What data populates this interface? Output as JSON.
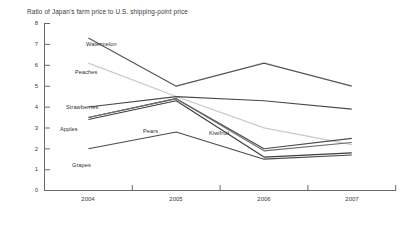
{
  "chart_data": {
    "type": "line",
    "title": "Ratio of Japan's farm price to U.S. shipping-point price",
    "xlabel": "",
    "ylabel": "",
    "categories": [
      "2004",
      "2005",
      "2006",
      "2007"
    ],
    "ylim": [
      0,
      8
    ],
    "yticks": [
      "0",
      "1",
      "2",
      "3",
      "4",
      "5",
      "6",
      "7",
      "8"
    ],
    "grid": false,
    "legend": "inline-labels",
    "series": [
      {
        "name": "Watermelon",
        "values": [
          7.3,
          5.0,
          6.1,
          5.0
        ],
        "color": "#555555"
      },
      {
        "name": "Peaches",
        "values": [
          6.1,
          4.5,
          3.0,
          2.2
        ],
        "color": "#c9c9c9"
      },
      {
        "name": "Strawberries",
        "values": [
          4.0,
          4.5,
          4.3,
          3.9
        ],
        "color": "#4a4a4a"
      },
      {
        "name": "Apples",
        "values": [
          3.5,
          4.4,
          2.0,
          2.5
        ],
        "color": "#4a4a4a"
      },
      {
        "name": "Pears",
        "values": [
          3.5,
          4.4,
          1.9,
          2.3
        ],
        "color": "#6e6e6e"
      },
      {
        "name": "Kiwifruit",
        "values": [
          3.4,
          4.3,
          1.6,
          1.8
        ],
        "color": "#3d3d3d"
      },
      {
        "name": "Grapes",
        "values": [
          2.0,
          2.8,
          1.5,
          1.7
        ],
        "color": "#4a4a4a"
      }
    ],
    "annotations": [
      {
        "text": "Watermelon",
        "x": 86,
        "y": 41
      },
      {
        "text": "Peaches",
        "x": 75,
        "y": 69
      },
      {
        "text": "Strawberries",
        "x": 66,
        "y": 104
      },
      {
        "text": "Apples",
        "x": 60,
        "y": 126
      },
      {
        "text": "Pears",
        "x": 143,
        "y": 128
      },
      {
        "text": "Kiwifruit",
        "x": 209,
        "y": 130
      },
      {
        "text": "Grapes",
        "x": 72,
        "y": 162
      }
    ]
  },
  "axes": {
    "y_labels": [
      "8",
      "7",
      "6",
      "5",
      "4",
      "3",
      "2",
      "1",
      "0"
    ],
    "x_labels": [
      "2004",
      "2005",
      "2006",
      "2007"
    ]
  }
}
